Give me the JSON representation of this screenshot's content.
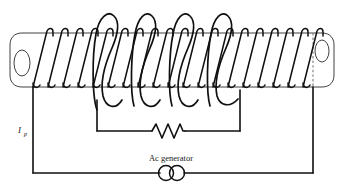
{
  "figure": {
    "type": "physics-circuit-diagram"
  },
  "labels": {
    "primary_current": "I",
    "primary_current_sub": "p",
    "generator": "Ac generator"
  },
  "components": [
    {
      "name": "cylindrical-core",
      "label": ""
    },
    {
      "name": "primary-coil",
      "label": ""
    },
    {
      "name": "secondary-coil",
      "label": ""
    },
    {
      "name": "resistor",
      "label": ""
    },
    {
      "name": "ac-generator-symbol",
      "label": "Ac generator"
    }
  ],
  "colors": {
    "ink": "#101010",
    "core_outline": "#2b2b2b",
    "dashed_line": "#7a7a7a",
    "background": "#ffffff"
  },
  "geometry": {
    "core": {
      "x_left": 22,
      "x_right": 322,
      "y_top": 33,
      "y_bottom": 87,
      "ellipse_rx": 8,
      "ellipse_ry": 13
    },
    "primary_turns": 19,
    "secondary_turns": 4,
    "primary_circuit": {
      "left_x": 33,
      "right_x": 313,
      "bottom_y": 173
    },
    "secondary_circuit": {
      "left_x": 97,
      "right_x": 240,
      "bottom_y": 131
    }
  }
}
